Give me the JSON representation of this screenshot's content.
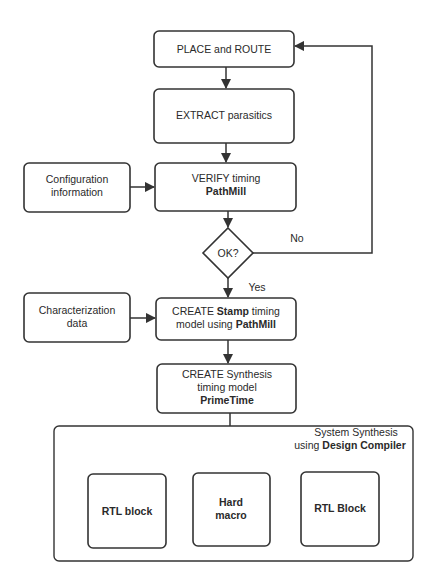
{
  "diagram": {
    "type": "flowchart",
    "colors": {
      "stroke": "#333333",
      "text": "#2a2a2a",
      "background": "#ffffff"
    },
    "nodes": {
      "place_route": {
        "line1": "PLACE and ROUTE"
      },
      "extract": {
        "line1": "EXTRACT parasitics"
      },
      "config": {
        "line1": "Configuration",
        "line2": "information"
      },
      "verify": {
        "line1": "VERIFY timing",
        "line2_bold": "PathMill"
      },
      "decision": {
        "label": "OK?"
      },
      "characterization": {
        "line1": "Characterization",
        "line2": "data"
      },
      "create_stamp": {
        "line1_pre": "CREATE ",
        "line1_bold": "Stamp",
        "line1_post": " timing",
        "line2_pre": "model using ",
        "line2_bold": "PathMill"
      },
      "create_synthesis": {
        "line1": "CREATE Synthesis",
        "line2": "timing model",
        "line3_bold": "PrimeTime"
      },
      "system_synthesis": {
        "line1": "System Synthesis",
        "line2_pre": "using ",
        "line2_bold": "Design Compiler"
      },
      "rtl_block_1": {
        "label": "RTL block"
      },
      "hard_macro": {
        "line1": "Hard",
        "line2": "macro"
      },
      "rtl_block_2": {
        "label": "RTL Block"
      }
    },
    "edges": {
      "no_label": "No",
      "yes_label": "Yes"
    },
    "edge_list": [
      {
        "from": "place_route",
        "to": "extract"
      },
      {
        "from": "extract",
        "to": "verify"
      },
      {
        "from": "config",
        "to": "verify"
      },
      {
        "from": "verify",
        "to": "decision"
      },
      {
        "from": "decision",
        "to": "place_route",
        "label": "No"
      },
      {
        "from": "decision",
        "to": "create_stamp",
        "label": "Yes"
      },
      {
        "from": "characterization",
        "to": "create_stamp"
      },
      {
        "from": "create_stamp",
        "to": "create_synthesis"
      },
      {
        "from": "create_synthesis",
        "to": "hard_macro"
      }
    ]
  }
}
